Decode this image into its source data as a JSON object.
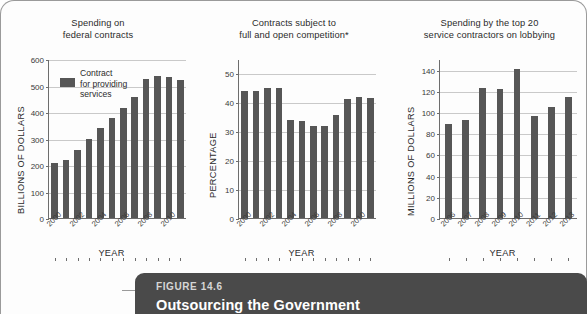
{
  "figure": {
    "label": "FIGURE 14.6",
    "title": "Outsourcing the Government",
    "accent_dark": "#4a4a4a",
    "bar_color": "#565656"
  },
  "legend": {
    "line1": "Contract",
    "line2": "for providing",
    "line3": "services"
  },
  "chart_data": [
    {
      "type": "bar",
      "title": "Spending on federal contracts",
      "title_line1": "Spending on",
      "title_line2": "federal contracts",
      "xlabel": "YEAR",
      "ylabel": "BILLIONS OF DOLLARS",
      "ylim": [
        0,
        600
      ],
      "yticks": [
        0,
        100,
        200,
        300,
        400,
        500,
        600
      ],
      "grid": true,
      "legend": [
        "Contract for providing services"
      ],
      "legend_position": "top-left-inside",
      "categories": [
        "2000",
        "2001",
        "2002",
        "2003",
        "2004",
        "2005",
        "2006",
        "2007",
        "2008",
        "2009",
        "2010",
        "2011"
      ],
      "tick_labels_shown": [
        "2000",
        "2002",
        "2004",
        "2006",
        "2008",
        "2010"
      ],
      "values": [
        208,
        218,
        258,
        297,
        338,
        379,
        415,
        456,
        524,
        537,
        534,
        519
      ]
    },
    {
      "type": "bar",
      "title": "Contracts subject to full and open competition*",
      "title_line1": "Contracts subject to",
      "title_line2": "full and open competition*",
      "xlabel": "YEAR",
      "ylabel": "PERCENTAGE",
      "ylim": [
        0,
        55
      ],
      "yticks": [
        0,
        10,
        20,
        30,
        40,
        50
      ],
      "grid": true,
      "categories": [
        "2000",
        "2001",
        "2002",
        "2003",
        "2004",
        "2005",
        "2006",
        "2007",
        "2008",
        "2009",
        "2010",
        "2011"
      ],
      "tick_labels_shown": [
        "2000",
        "2002",
        "2004",
        "2006",
        "2008",
        "2010"
      ],
      "values": [
        44,
        44,
        45,
        45,
        34,
        33.5,
        32,
        32,
        35.5,
        41,
        42,
        41.5
      ]
    },
    {
      "type": "bar",
      "title": "Spending by the top 20 service contractors on lobbying",
      "title_line1": "Spending by the top 20",
      "title_line2": "service contractors on lobbying",
      "xlabel": "YEAR",
      "ylabel": "MILLIONS OF DOLLARS",
      "ylim": [
        0,
        150
      ],
      "yticks": [
        0,
        20,
        40,
        60,
        80,
        100,
        120,
        140
      ],
      "grid": true,
      "categories": [
        "2006",
        "2007",
        "2008",
        "2009",
        "2010",
        "2011",
        "2012",
        "2013"
      ],
      "tick_labels_shown": [
        "2006",
        "2007",
        "2008",
        "2009",
        "2010",
        "2011",
        "2012",
        "2013"
      ],
      "values": [
        89,
        92,
        123,
        122,
        141,
        96,
        105,
        114
      ]
    }
  ]
}
